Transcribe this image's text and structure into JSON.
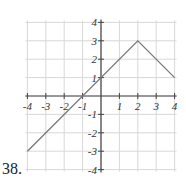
{
  "problem_number": "38.",
  "chart_data": {
    "type": "line",
    "title": "",
    "xlabel": "",
    "ylabel": "",
    "xlim": [
      -4,
      4
    ],
    "ylim": [
      -4,
      4
    ],
    "grid": true,
    "x_ticks": [
      "-4",
      "-3",
      "-2",
      "-1",
      "1",
      "2",
      "3",
      "4"
    ],
    "y_ticks": [
      "4",
      "3",
      "2",
      "1",
      "-1",
      "-2",
      "-3",
      "-4"
    ],
    "series": [
      {
        "name": "f(x)",
        "points": [
          [
            -4,
            -3
          ],
          [
            2,
            3
          ],
          [
            4,
            1
          ]
        ],
        "color": "#777777"
      }
    ]
  }
}
